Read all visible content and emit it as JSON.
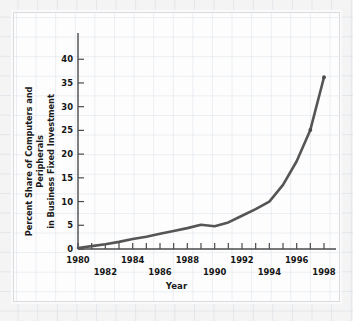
{
  "chart_data": {
    "type": "line",
    "title": "",
    "xlabel": "Year",
    "ylabel": "Percent Share of Computers and Peripherals in Business Fixed Investment",
    "ylabel_line1": "Percent Share of Computers and Peripherals",
    "ylabel_line2": "in Business Fixed Investment",
    "x": [
      1980,
      1981,
      1982,
      1983,
      1984,
      1985,
      1986,
      1987,
      1988,
      1989,
      1990,
      1991,
      1992,
      1993,
      1994,
      1995,
      1996,
      1997,
      1998
    ],
    "values": [
      0.2,
      0.6,
      1.0,
      1.5,
      2.1,
      2.6,
      3.2,
      3.8,
      4.4,
      5.1,
      4.8,
      5.6,
      7.0,
      8.4,
      10.0,
      13.5,
      18.5,
      25.1,
      36.2
    ],
    "series": [
      {
        "name": "Percent share",
        "values": [
          0.2,
          0.6,
          1.0,
          1.5,
          2.1,
          2.6,
          3.2,
          3.8,
          4.4,
          5.1,
          4.8,
          5.6,
          7.0,
          8.4,
          10.0,
          13.5,
          18.5,
          25.1,
          36.2
        ]
      }
    ],
    "xlim": [
      1980,
      1998
    ],
    "ylim": [
      0,
      43
    ],
    "ytick_labels": [
      "0",
      "5",
      "10",
      "15",
      "20",
      "25",
      "30",
      "35",
      "40"
    ],
    "ytick_values": [
      0,
      5,
      10,
      15,
      20,
      25,
      30,
      35,
      40
    ],
    "xtick_values": [
      1980,
      1981,
      1982,
      1983,
      1984,
      1985,
      1986,
      1987,
      1988,
      1989,
      1990,
      1991,
      1992,
      1993,
      1994,
      1995,
      1996,
      1997,
      1998
    ],
    "xtick_labels_upper": [
      {
        "year": 1980,
        "label": "1980"
      },
      {
        "year": 1984,
        "label": "1984"
      },
      {
        "year": 1988,
        "label": "1988"
      },
      {
        "year": 1992,
        "label": "1992"
      },
      {
        "year": 1996,
        "label": "1996"
      }
    ],
    "xtick_labels_lower": [
      {
        "year": 1982,
        "label": "1982"
      },
      {
        "year": 1986,
        "label": "1986"
      },
      {
        "year": 1990,
        "label": "1990"
      },
      {
        "year": 1994,
        "label": "1994"
      },
      {
        "year": 1998,
        "label": "1998"
      }
    ],
    "grid": true,
    "legend": null,
    "legend_position": "none",
    "markers": [
      {
        "x": 1997,
        "y": 25.1
      },
      {
        "x": 1998,
        "y": 36.2
      }
    ],
    "colors": {
      "line": "#555555",
      "axis": "#4a4a4a",
      "text": "#151515",
      "background": "#fdfdfd",
      "grid": "#d0d8e2",
      "page_background": "#f2f2f2"
    }
  }
}
